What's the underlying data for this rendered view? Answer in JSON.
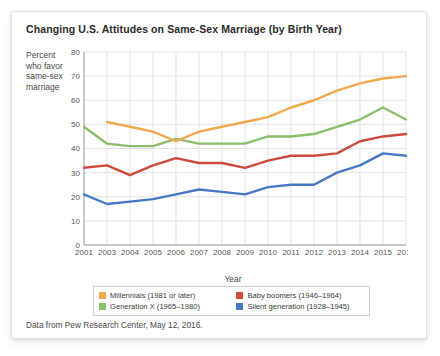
{
  "card": {
    "title": "Changing U.S. Attitudes on Same-Sex Marriage (by Birth Year)",
    "source_note": "Data from Pew Research Center, May 12, 2016.",
    "ylabel_line1": "Percent",
    "ylabel_line2": "who favor",
    "ylabel_line3": "same-sex",
    "ylabel_line4": "marriage"
  },
  "legend": {
    "items": [
      {
        "label": "Millennials (1981 or later)",
        "color": "#f0a94c"
      },
      {
        "label": "Baby boomers (1946–1964)",
        "color": "#cc4b3c"
      },
      {
        "label": "Generation X (1965–1980)",
        "color": "#8cbf6b"
      },
      {
        "label": "Silent generation (1928–1945)",
        "color": "#4779c4"
      }
    ]
  },
  "chart_data": {
    "type": "line",
    "title": "Changing U.S. Attitudes on Same-Sex Marriage (by Birth Year)",
    "xlabel": "Year",
    "ylabel": "Percent who favor same-sex marriage",
    "categories": [
      "2001",
      "2003",
      "2004",
      "2005",
      "2006",
      "2007",
      "2008",
      "2009",
      "2010",
      "2011",
      "2012",
      "2013",
      "2014",
      "2015",
      "2016"
    ],
    "xlim": [
      0,
      14
    ],
    "ylim": [
      0,
      80
    ],
    "yticks": [
      0,
      10,
      20,
      30,
      40,
      50,
      60,
      70,
      80
    ],
    "grid": true,
    "legend_position": "bottom",
    "series": [
      {
        "name": "Millennials (1981 or later)",
        "color": "#f0a94c",
        "values": [
          null,
          51,
          49,
          47,
          43,
          47,
          49,
          51,
          53,
          57,
          60,
          64,
          67,
          69,
          70
        ]
      },
      {
        "name": "Generation X (1965–1980)",
        "color": "#8cbf6b",
        "values": [
          49,
          42,
          41,
          41,
          44,
          42,
          42,
          42,
          45,
          45,
          46,
          49,
          52,
          57,
          52
        ]
      },
      {
        "name": "Baby boomers (1946–1964)",
        "color": "#cc4b3c",
        "values": [
          32,
          33,
          29,
          33,
          36,
          34,
          34,
          32,
          35,
          37,
          37,
          38,
          43,
          45,
          46
        ]
      },
      {
        "name": "Silent generation (1928–1945)",
        "color": "#4779c4",
        "values": [
          21,
          17,
          18,
          19,
          21,
          23,
          22,
          21,
          24,
          25,
          25,
          30,
          33,
          38,
          37
        ]
      }
    ]
  }
}
